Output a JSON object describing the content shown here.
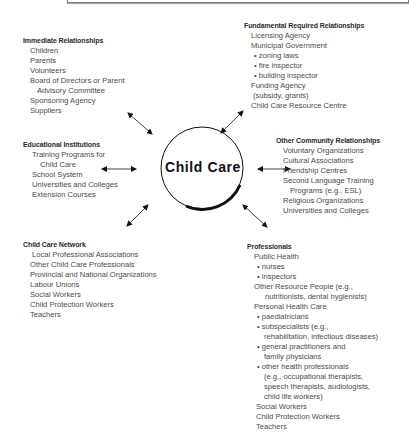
{
  "center": {
    "label": "Child Care"
  },
  "groups": {
    "immediate": {
      "title": "Immediate Relationships",
      "items": [
        "Children",
        "Parents",
        "Volunteers",
        "Board of Directors or Parent",
        "Advisory Committee",
        "Sponsoring Agency",
        "Suppliers"
      ]
    },
    "fundamental": {
      "title": "Fundamental Required Relationships",
      "items": [
        "Licensing Agency",
        "Municipal Government",
        "zoning laws",
        "fire inspector",
        "building inspector",
        "Funding Agency",
        "(subsidy, grants)",
        "Child Care Resource Centre"
      ]
    },
    "educational": {
      "title": "Educational Institutions",
      "items": [
        "Training Programs for",
        "Child Care",
        "School System",
        "Universities and Colleges",
        "Extension Courses"
      ]
    },
    "community": {
      "title": "Other Community Relationships",
      "items": [
        "Voluntary Organizations",
        "Cultural Associations",
        "Friendship Centres",
        "Second Language Training",
        "Programs (e.g., ESL)",
        "Religious Organizations",
        "Universities and Colleges"
      ]
    },
    "network": {
      "title": "Child Care Network",
      "items": [
        "Local Professional Associations",
        "Other Child Care Professionals",
        "Provincial and National Organizations",
        "Labour Unions",
        "Social Workers",
        "Child Protection Workers",
        "Teachers"
      ]
    },
    "professionals": {
      "title": "Professionals",
      "items": [
        "Public Health",
        "nurses",
        "inspectors",
        "Other Resource People (e.g.,",
        "nutritionists, dental hygienists)",
        "Personal Health Care",
        "paediatricians",
        "subspecialists (e.g.,",
        "rehabilitation, infectious diseases)",
        "general practitioners and",
        "family physicians",
        "other health professionals",
        "(e.g., occupational therapists,",
        "speech therapists, audiologists,",
        "child life workers)",
        "Social Workers",
        "Child Protection Workers",
        "Teachers"
      ]
    }
  },
  "arrows": [
    {
      "name": "arrow-immediate",
      "x1": 128,
      "y1": 113,
      "x2": 152,
      "y2": 134
    },
    {
      "name": "arrow-fundamental",
      "x1": 243,
      "y1": 111,
      "x2": 221,
      "y2": 133
    },
    {
      "name": "arrow-educational",
      "x1": 102,
      "y1": 169,
      "x2": 136,
      "y2": 169
    },
    {
      "name": "arrow-community",
      "x1": 258,
      "y1": 169,
      "x2": 290,
      "y2": 169
    },
    {
      "name": "arrow-network",
      "x1": 148,
      "y1": 205,
      "x2": 127,
      "y2": 226
    },
    {
      "name": "arrow-professionals",
      "x1": 243,
      "y1": 205,
      "x2": 267,
      "y2": 227
    }
  ]
}
